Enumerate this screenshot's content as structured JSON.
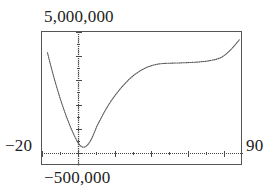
{
  "chart_data": {
    "type": "line",
    "title": "",
    "subtitle": "",
    "xlabel": "",
    "ylabel": "",
    "grid": false,
    "legend": false,
    "axis_labels": {
      "y_max": "5,000,000",
      "y_min": "−500,000",
      "x_min": "−20",
      "x_max": "90"
    },
    "xlim": [
      -20,
      90
    ],
    "ylim": [
      -500000,
      5000000
    ],
    "axis_origin": {
      "x": 0,
      "y": 0
    },
    "tick_spacing": {
      "x": 10,
      "y": 500000
    },
    "series": [
      {
        "name": "curve",
        "color": "#555555",
        "style": "dotted",
        "x": [
          -17.0,
          -16.0,
          -15.0,
          -14.0,
          -13.0,
          -12.0,
          -11.0,
          -10.0,
          -9.0,
          -8.0,
          -7.0,
          -6.0,
          -5.0,
          -4.0,
          -3.0,
          -2.0,
          -1.0,
          0.0,
          1.0,
          2.0,
          3.0,
          4.0,
          5.0,
          6.0,
          7.0,
          8.0,
          9.0,
          10.0,
          12.0,
          14.0,
          16.0,
          18.0,
          20.0,
          22.0,
          24.0,
          26.0,
          28.0,
          30.0,
          32.0,
          34.0,
          36.0,
          38.0,
          40.0,
          42.0,
          44.0,
          46.0,
          48.0,
          50.0,
          55.0,
          60.0,
          65.0,
          70.0,
          75.0,
          78.0,
          80.0,
          82.0,
          84.0,
          86.0,
          88.0
        ],
        "y": [
          4150000,
          3850000,
          3560000,
          3280000,
          3010000,
          2750000,
          2500000,
          2260000,
          2030000,
          1810000,
          1600000,
          1400000,
          1210000,
          1030000,
          860000,
          700000,
          550000,
          420000,
          330000,
          280000,
          270000,
          300000,
          370000,
          470000,
          600000,
          760000,
          940000,
          1130000,
          1420000,
          1700000,
          1960000,
          2190000,
          2400000,
          2590000,
          2770000,
          2930000,
          3080000,
          3210000,
          3320000,
          3420000,
          3500000,
          3570000,
          3620000,
          3660000,
          3690000,
          3705000,
          3715000,
          3720000,
          3730000,
          3745000,
          3765000,
          3800000,
          3870000,
          3950000,
          4050000,
          4180000,
          4330000,
          4500000,
          4680000
        ]
      }
    ]
  }
}
